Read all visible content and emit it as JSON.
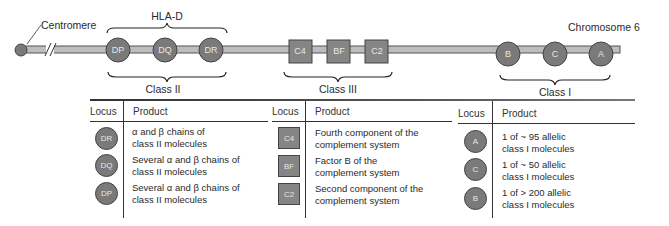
{
  "figure": {
    "chromosome_label": "Chromosome 6",
    "centromere_label": "Centromere",
    "region_label": "HLA-D",
    "class_labels": {
      "class_ii": "Class II",
      "class_iii": "Class III",
      "class_i": "Class I"
    },
    "markers_on_chromosome": {
      "class_ii": [
        "DP",
        "DQ",
        "DR"
      ],
      "class_iii": [
        "C4",
        "BF",
        "C2"
      ],
      "class_i": [
        "B",
        "C",
        "A"
      ]
    },
    "colors": {
      "marker_fill": "#7a7a7a",
      "chromosome_fill": "#bdbdbd",
      "outline": "#444444"
    }
  },
  "table": {
    "headers": {
      "locus": "Locus",
      "product": "Product"
    },
    "class_ii_rows": [
      {
        "locus": "DR",
        "product_line1": "α and β chains of",
        "product_line2": "class II molecules"
      },
      {
        "locus": "DQ",
        "product_line1": "Several α and β chains of",
        "product_line2": "class II molecules"
      },
      {
        "locus": "DP",
        "product_line1": "Several α and β chains of",
        "product_line2": "class II molecules"
      }
    ],
    "class_iii_rows": [
      {
        "locus": "C4",
        "product_line1": "Fourth component of the",
        "product_line2": "complement system"
      },
      {
        "locus": "BF",
        "product_line1": "Factor B of the",
        "product_line2": "complement system"
      },
      {
        "locus": "C2",
        "product_line1": "Second component of the",
        "product_line2": "complement system"
      }
    ],
    "class_i_rows": [
      {
        "locus": "A",
        "product_line1": "1 of ~ 95 allelic",
        "product_line2": "class I molecules"
      },
      {
        "locus": "C",
        "product_line1": "1 of ~ 50 allelic",
        "product_line2": "class I molecules"
      },
      {
        "locus": "B",
        "product_line1": "1 of > 200 allelic",
        "product_line2": "class I molecules"
      }
    ]
  }
}
